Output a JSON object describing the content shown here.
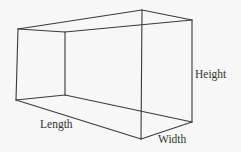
{
  "diagram": {
    "type": "rectangular-prism-wireframe",
    "labels": {
      "length": "Length",
      "width": "Width",
      "height": "Height"
    },
    "stroke_color": "#3a3a3a",
    "background_color": "#f7f7f7",
    "vertices": {
      "front_top_left": [
        18,
        29
      ],
      "front_bottom_left": [
        16,
        100
      ],
      "back_top_left": [
        65,
        32
      ],
      "back_bottom_left": [
        65,
        95
      ],
      "top_back_right": [
        142,
        10
      ],
      "top_front_right": [
        192,
        20
      ],
      "bottom_front_right": [
        192,
        122
      ],
      "bottom_front_corner": [
        141,
        139
      ],
      "hidden_mid_right": [
        141,
        111
      ]
    }
  }
}
